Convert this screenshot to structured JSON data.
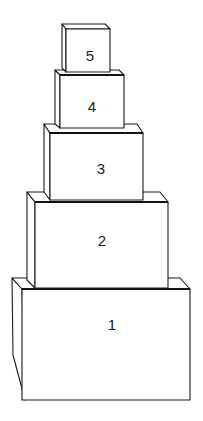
{
  "diagram": {
    "title": "",
    "line_color": "#1a1a1a",
    "background": "#ffffff",
    "boxes": [
      {
        "label": "1",
        "front": [
          22,
          289,
          190,
          400
        ],
        "depth": [
          -10,
          -11
        ]
      },
      {
        "label": "2",
        "front": [
          35,
          202,
          168,
          288
        ],
        "depth": [
          -8,
          -10
        ]
      },
      {
        "label": "3",
        "front": [
          50,
          133,
          143,
          200
        ],
        "depth": [
          -6,
          -9
        ]
      },
      {
        "label": "4",
        "front": [
          60,
          75,
          124,
          128
        ],
        "depth": [
          -5,
          -5
        ]
      },
      {
        "label": "5",
        "front": [
          66,
          29,
          110,
          72
        ],
        "depth": [
          -4,
          -5
        ]
      }
    ]
  }
}
